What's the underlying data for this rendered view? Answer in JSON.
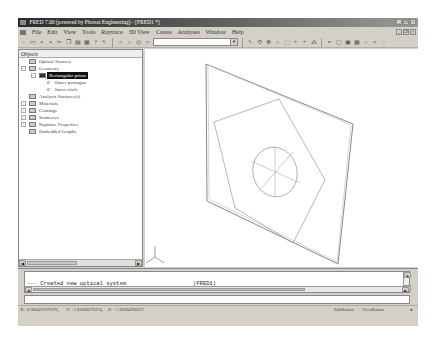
{
  "window": {
    "title": "FRED 7.00 (powered by Photon Engineering) - [FRED1 *]",
    "controls": [
      "_",
      "❐",
      "×"
    ]
  },
  "menubar": {
    "items": [
      "File",
      "Edit",
      "View",
      "Tools",
      "Raytrace",
      "3D View",
      "Create",
      "Analyses",
      "Window",
      "Help"
    ]
  },
  "toolbar": {
    "left_icons": [
      "new-icon",
      "open-icon",
      "save-icon",
      "save-all-icon",
      "cut-icon",
      "copy-icon",
      "paste-icon",
      "print-icon",
      "help-icon",
      "context-help-icon",
      "zoom-icon",
      "zoom-all-icon",
      "target-icon",
      "filter-icon"
    ],
    "combo_value": "",
    "right_icons": [
      "select-icon",
      "rotate-icon",
      "pan-icon",
      "zoom-view-icon",
      "zoom-window-icon",
      "xy-icon",
      "yz-icon",
      "xz-icon",
      "iso-icon",
      "trace-icon",
      "render-icon",
      "layer-icon",
      "display-icon",
      "lighting-icon",
      "settings-icon"
    ]
  },
  "tree": {
    "header": "Objects",
    "items": [
      {
        "label": "Optical Sources",
        "level": 1,
        "expander": ""
      },
      {
        "label": "Geometry",
        "level": 1,
        "expander": "−"
      },
      {
        "label": "Rectangular prism",
        "level": 2,
        "expander": "−",
        "selected": true
      },
      {
        "label": "Outer pentagon",
        "level": 3,
        "expander": ""
      },
      {
        "label": "Inner circle",
        "level": 3,
        "expander": ""
      },
      {
        "label": "Analysis Surfaces(s)",
        "level": 1,
        "expander": ""
      },
      {
        "label": "Materials",
        "level": 1,
        "expander": "+"
      },
      {
        "label": "Coatings",
        "level": 1,
        "expander": "+"
      },
      {
        "label": "Scatterers",
        "level": 1,
        "expander": "+"
      },
      {
        "label": "Raytrace Properties",
        "level": 1,
        "expander": "+"
      },
      {
        "label": "Embedded Graphs",
        "level": 1,
        "expander": ""
      }
    ]
  },
  "output": {
    "line": "--- Created new optical system",
    "tag": "(FRED1)",
    "command_value": ""
  },
  "statusbar": {
    "x": "X: -0.906457679376,",
    "y": "Y: +1.83600279374,",
    "z": "Z: +1.30284690227",
    "mode1": "EditButton",
    "mode2": "ViewButton"
  }
}
